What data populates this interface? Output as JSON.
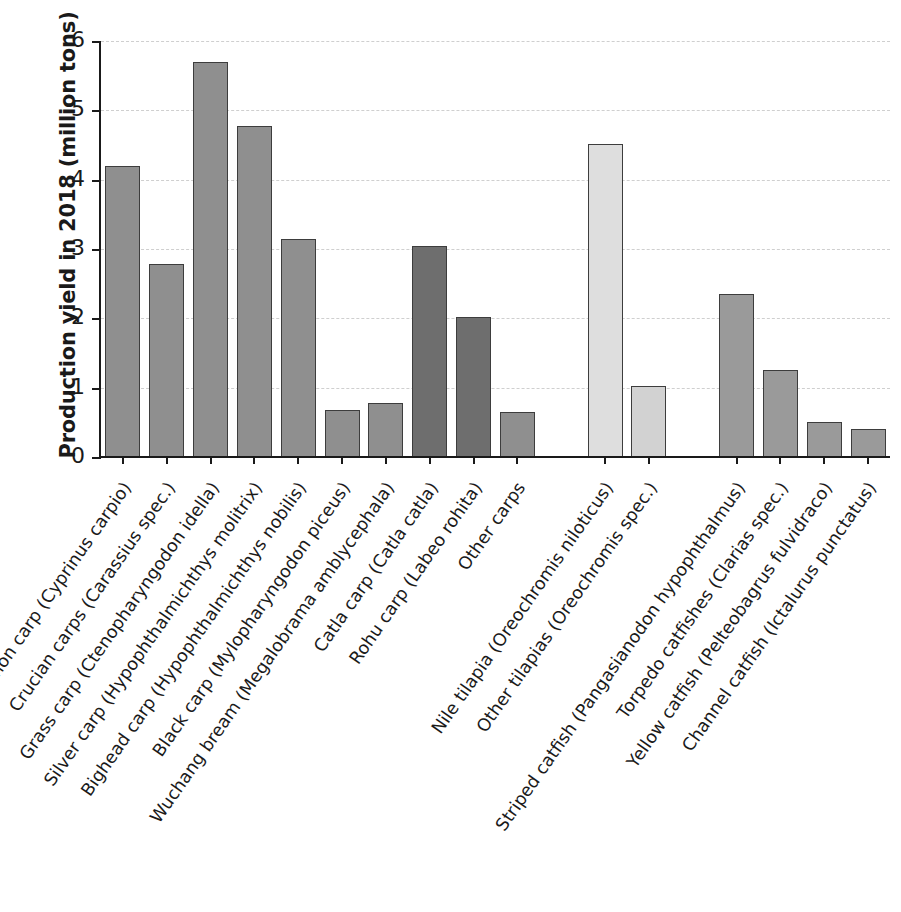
{
  "chart_data": {
    "type": "bar",
    "title": "",
    "xlabel": "",
    "ylabel": "Production yield in 2018 (million tons)",
    "ylim": [
      0,
      6
    ],
    "yticks": [
      "0",
      "1",
      "2",
      "3",
      "4",
      "5",
      "6"
    ],
    "grid": "horizontal-dashed",
    "legend": "none",
    "categories": [
      "Common carp (Cyprinus carpio)",
      "Crucian carps (Carassius spec.)",
      "Grass carp (Ctenopharyngodon idella)",
      "Silver carp (Hypophthalmichthys molitrix)",
      "Bighead carp (Hypophthalmichthys nobilis)",
      "Black carp (Mylopharyngodon piceus)",
      "Wuchang bream (Megalobrama amblycephala)",
      "Catla carp (Catla catla)",
      "Rohu carp (Labeo rohita)",
      "Other carps",
      "Nile tilapia (Oreochromis niloticus)",
      "Other tilapias (Oreochromis spec.)",
      "Striped catfish (Pangasianodon hypophthalmus)",
      "Torpedo catfishes (Clarias spec.)",
      "Yellow catfish (Pelteobagrus fulvidraco)",
      "Channel catfish (Ictalurus punctatus)"
    ],
    "values": [
      4.2,
      2.78,
      5.7,
      4.78,
      3.14,
      0.68,
      0.78,
      3.05,
      2.02,
      0.65,
      4.52,
      1.03,
      2.35,
      1.25,
      0.5,
      0.4
    ],
    "bar_colors": [
      "#8f8f8f",
      "#8f8f8f",
      "#8f8f8f",
      "#8f8f8f",
      "#8f8f8f",
      "#8f8f8f",
      "#8f8f8f",
      "#6e6e6e",
      "#6e6e6e",
      "#8f8f8f",
      "#dedede",
      "#d2d2d2",
      "#9a9a9a",
      "#9a9a9a",
      "#9a9a9a",
      "#9a9a9a"
    ],
    "bar_edge_color": "#3d3d3d",
    "gridline_color": "#cfcfcf",
    "axis_color": "#1a1a1a",
    "groups": [
      {
        "name": "carps",
        "from": 0,
        "to": 9
      },
      {
        "name": "tilapias",
        "from": 10,
        "to": 11
      },
      {
        "name": "catfishes",
        "from": 12,
        "to": 15
      }
    ]
  }
}
